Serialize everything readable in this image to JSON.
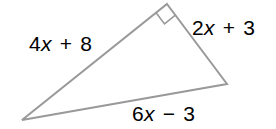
{
  "figure": {
    "type": "right-triangle-with-algebraic-side-labels",
    "background_color": "#ffffff",
    "stroke_color": "#999999",
    "stroke_width": 2,
    "text_color": "#000000",
    "vertices": {
      "apex": [
        167,
        4
      ],
      "right": [
        227,
        84
      ],
      "bottom_left": [
        22,
        120
      ]
    },
    "right_angle_marker": {
      "at_vertex": "apex",
      "shape": "square",
      "size": 14
    },
    "labels": {
      "left_side": {
        "full_text": "4x + 8",
        "coefficient": "4",
        "variable": "x",
        "operator": "+",
        "constant": "8"
      },
      "right_side": {
        "full_text": "2x + 3",
        "coefficient": "2",
        "variable": "x",
        "operator": "+",
        "constant": "3"
      },
      "bottom_side": {
        "full_text": "6x − 3",
        "coefficient": "6",
        "variable": "x",
        "operator": "−",
        "constant": "3"
      }
    }
  }
}
